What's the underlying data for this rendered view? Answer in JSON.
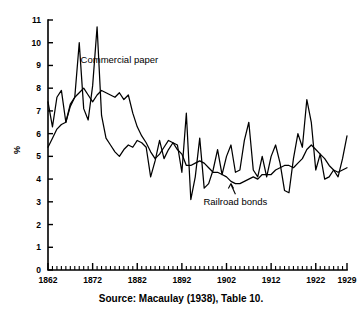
{
  "figure": {
    "caption": "Source: Macaulay (1938), Table 10.",
    "ylabel": "%"
  },
  "chart_data": {
    "type": "line",
    "title": "",
    "xlabel": "",
    "ylabel": "%",
    "xlim": [
      1862,
      1929
    ],
    "ylim": [
      0,
      11
    ],
    "grid": false,
    "legend_position": "inline-annotations",
    "xticks": [
      1862,
      1872,
      1882,
      1892,
      1902,
      1912,
      1922,
      1929
    ],
    "xtick_labels": [
      "1862",
      "1872",
      "1882",
      "1892",
      "1902",
      "1912",
      "1922",
      "1929"
    ],
    "xticks_minor_interval": 1,
    "yticks": [
      0,
      1,
      2,
      3,
      4,
      5,
      6,
      7,
      8,
      9,
      10,
      11
    ],
    "ytick_labels": [
      "0",
      "1",
      "2",
      "3",
      "4",
      "5",
      "6",
      "7",
      "8",
      "9",
      "10",
      "11"
    ],
    "annotations": [
      {
        "text": "Commercial paper",
        "x": 1878,
        "y": 9.1
      },
      {
        "text": "Railroad bonds",
        "x": 1904,
        "y": 2.85,
        "arrow_to_x": 1903,
        "arrow_to_y": 3.85
      }
    ],
    "x": [
      1862,
      1863,
      1864,
      1865,
      1866,
      1867,
      1868,
      1869,
      1870,
      1871,
      1872,
      1873,
      1874,
      1875,
      1876,
      1877,
      1878,
      1879,
      1880,
      1881,
      1882,
      1883,
      1884,
      1885,
      1886,
      1887,
      1888,
      1889,
      1890,
      1891,
      1892,
      1893,
      1894,
      1895,
      1896,
      1897,
      1898,
      1899,
      1900,
      1901,
      1902,
      1903,
      1904,
      1905,
      1906,
      1907,
      1908,
      1909,
      1910,
      1911,
      1912,
      1913,
      1914,
      1915,
      1916,
      1917,
      1918,
      1919,
      1920,
      1921,
      1922,
      1923,
      1924,
      1925,
      1926,
      1927,
      1928,
      1929
    ],
    "series": [
      {
        "name": "Commercial paper",
        "values": [
          7.4,
          6.3,
          7.6,
          7.9,
          6.5,
          7.2,
          7.6,
          10.0,
          7.1,
          6.6,
          8.1,
          10.7,
          6.8,
          5.8,
          5.5,
          5.2,
          5.0,
          5.3,
          5.5,
          5.4,
          5.7,
          5.6,
          5.4,
          4.1,
          4.8,
          5.7,
          4.9,
          5.3,
          5.6,
          5.5,
          4.3,
          6.9,
          3.1,
          4.1,
          5.8,
          3.6,
          3.8,
          4.4,
          5.3,
          4.2,
          5.0,
          5.5,
          4.3,
          4.4,
          5.7,
          6.5,
          4.4,
          4.1,
          5.0,
          4.1,
          5.0,
          5.5,
          4.7,
          3.5,
          3.4,
          4.9,
          6.0,
          5.4,
          7.5,
          6.5,
          4.4,
          5.1,
          4.0,
          4.1,
          4.4,
          4.1,
          4.9,
          5.9
        ]
      },
      {
        "name": "Railroad bonds",
        "values": [
          5.4,
          5.8,
          6.2,
          6.4,
          6.5,
          7.3,
          7.6,
          7.8,
          8.0,
          7.7,
          7.4,
          7.7,
          7.9,
          7.8,
          7.7,
          7.6,
          7.8,
          7.5,
          7.7,
          6.9,
          6.3,
          5.9,
          5.6,
          5.2,
          4.9,
          5.1,
          5.4,
          5.7,
          5.6,
          5.3,
          5.1,
          4.6,
          4.6,
          4.7,
          4.8,
          4.7,
          4.5,
          4.3,
          4.3,
          4.2,
          4.1,
          3.9,
          3.8,
          3.8,
          3.9,
          4.0,
          4.1,
          4.0,
          4.2,
          4.2,
          4.2,
          4.4,
          4.5,
          4.6,
          4.6,
          4.5,
          4.7,
          4.9,
          5.3,
          5.5,
          5.3,
          5.1,
          4.9,
          4.6,
          4.4,
          4.3,
          4.4,
          4.5
        ]
      }
    ]
  }
}
